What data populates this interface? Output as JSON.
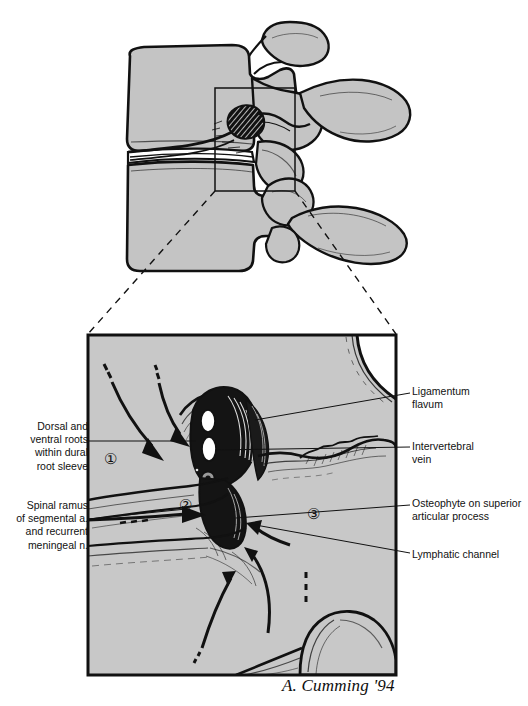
{
  "figure": {
    "signature": "A. Cumming '94",
    "colors": {
      "bone_fill": "#c4c4c4",
      "panel_fill": "#c8c8c8",
      "ink": "#111111",
      "white": "#ffffff",
      "paper": "#ffffff"
    }
  },
  "overview": {
    "name": "lumbar-vertebrae-sagittal-overview",
    "inset_box_label": "magnification-region"
  },
  "panel": {
    "name": "magnified-foramen-panel",
    "bounds": {
      "x": 87,
      "y": 334,
      "width": 310,
      "height": 342
    }
  },
  "callouts": {
    "numbers": [
      {
        "id": "1",
        "text": "①",
        "x": 104,
        "y": 458,
        "meaning": "dorsal-and-ventral-roots-zone"
      },
      {
        "id": "2",
        "text": "②",
        "x": 179,
        "y": 504,
        "meaning": "spinal-ramus-zone"
      },
      {
        "id": "3",
        "text": "③",
        "x": 307,
        "y": 513,
        "meaning": "osteophyte-zone"
      }
    ]
  },
  "labels": {
    "left": [
      {
        "name": "label-dorsal-ventral-roots",
        "text": "Dorsal and\nventral roots\nwithin dural\nroot sleeve",
        "x": 10,
        "y": 420,
        "width": 78,
        "leader": {
          "x1": 88,
          "y1": 441,
          "x2": 196,
          "y2": 441
        }
      },
      {
        "name": "label-spinal-ramus",
        "text": "Spinal ramus\nof segmental a.\nand recurrent\nmeningeal n.",
        "x": 4,
        "y": 499,
        "width": 84,
        "leader": {
          "x1": 88,
          "y1": 519,
          "x2": 185,
          "y2": 509
        }
      }
    ],
    "right": [
      {
        "name": "label-ligamentum-flavum",
        "text": "Ligamentum\nflavum",
        "x": 412,
        "y": 385,
        "width": 110,
        "leader": {
          "x1": 410,
          "y1": 393,
          "x2": 255,
          "y2": 420
        }
      },
      {
        "name": "label-intervertebral-vein",
        "text": "Intervertebral\nvein",
        "x": 412,
        "y": 440,
        "width": 110,
        "leader": {
          "x1": 410,
          "y1": 447,
          "x2": 215,
          "y2": 450
        }
      },
      {
        "name": "label-osteophyte-superior-articular-process",
        "text": "Osteophyte on superior\narticular process",
        "x": 412,
        "y": 497,
        "width": 116,
        "leader": {
          "x1": 410,
          "y1": 505,
          "x2": 236,
          "y2": 518
        }
      },
      {
        "name": "label-lymphatic-channel",
        "text": "Lymphatic channel",
        "x": 412,
        "y": 548,
        "width": 116,
        "leader": {
          "x1": 410,
          "y1": 553,
          "x2": 250,
          "y2": 524
        }
      }
    ]
  }
}
